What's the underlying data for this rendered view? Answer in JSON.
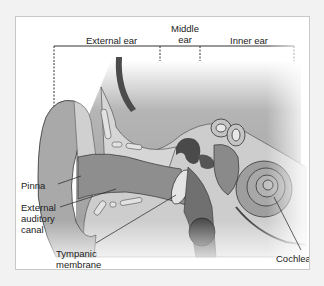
{
  "diagram": {
    "regions": [
      {
        "id": "external",
        "label": "External ear"
      },
      {
        "id": "middle",
        "label_line1": "Middle",
        "label_line2": "ear"
      },
      {
        "id": "inner",
        "label": "Inner ear"
      }
    ],
    "callouts": {
      "pinna": "Pinna",
      "eac_line1": "External",
      "eac_line2": "auditory",
      "eac_line3": "canal",
      "tympanic_line1": "Tympanic",
      "tympanic_line2": "membrane",
      "cochlea": "Cochlea"
    },
    "colors": {
      "frame_border": "#c8c8c8",
      "background": "#f2f2f2",
      "bone": "#cfcfcf",
      "tissue": "#9a9a9a",
      "dark": "#555555",
      "outline": "#3a3a3a"
    }
  }
}
